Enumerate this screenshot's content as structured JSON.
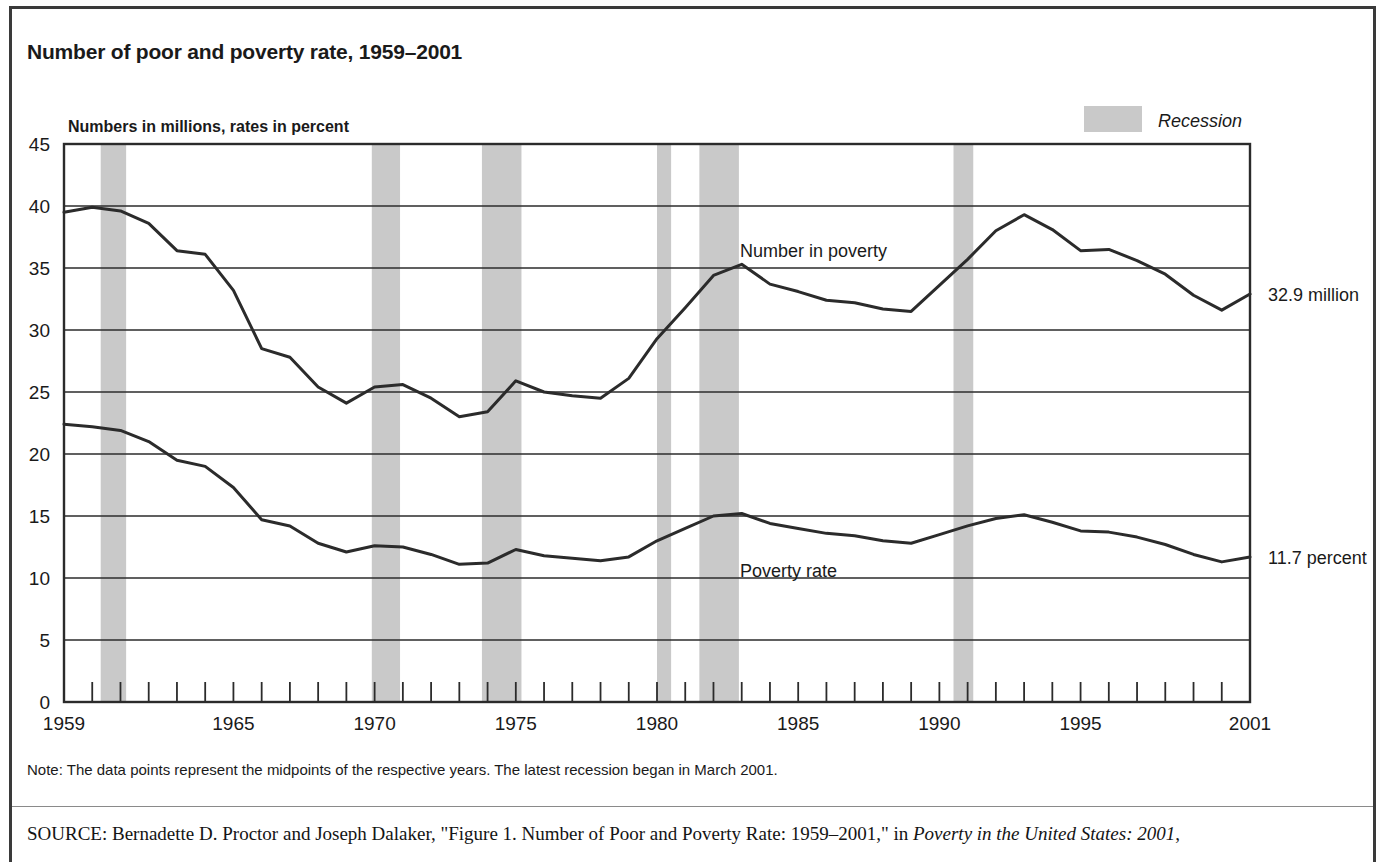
{
  "figure": {
    "title": "Number of poor and poverty rate, 1959–2001",
    "note": "Note: The data points represent the midpoints of the respective years. The latest recession began in March 2001.",
    "source_label": "SOURCE",
    "source_text_before_italic": ": Bernadette D. Proctor and Joseph Dalaker, \"Figure 1. Number of Poor and Poverty Rate: 1959–2001,\" in ",
    "source_italic": "Poverty in the United States: 2001",
    "source_text_after_italic": ","
  },
  "legend": {
    "recession_label": "Recession",
    "recession_color": "#c9c9c9"
  },
  "annotations": {
    "number_endpoint": "32.9 million",
    "rate_endpoint": "11.7 percent",
    "number_series_label": "Number in poverty",
    "rate_series_label": "Poverty rate"
  },
  "chart_data": {
    "type": "line",
    "title": "Number of poor and poverty rate, 1959–2001",
    "subtitle": "Numbers in millions, rates in percent",
    "xlabel": "",
    "ylabel": "Numbers in millions, rates in percent",
    "xlim": [
      1959,
      2001
    ],
    "ylim": [
      0,
      45
    ],
    "y_ticks": [
      0,
      5,
      10,
      15,
      20,
      25,
      30,
      35,
      40,
      45
    ],
    "x_tick_years_all": [
      1959,
      1960,
      1961,
      1962,
      1963,
      1964,
      1965,
      1966,
      1967,
      1968,
      1969,
      1970,
      1971,
      1972,
      1973,
      1974,
      1975,
      1976,
      1977,
      1978,
      1979,
      1980,
      1981,
      1982,
      1983,
      1984,
      1985,
      1986,
      1987,
      1988,
      1989,
      1990,
      1991,
      1992,
      1993,
      1994,
      1995,
      1996,
      1997,
      1998,
      1999,
      2000,
      2001
    ],
    "x_tick_labels": [
      {
        "year": 1959,
        "label": "1959"
      },
      {
        "year": 1965,
        "label": "1965"
      },
      {
        "year": 1970,
        "label": "1970"
      },
      {
        "year": 1975,
        "label": "1975"
      },
      {
        "year": 1980,
        "label": "1980"
      },
      {
        "year": 1985,
        "label": "1985"
      },
      {
        "year": 1990,
        "label": "1990"
      },
      {
        "year": 1995,
        "label": "1995"
      },
      {
        "year": 2001,
        "label": "2001"
      }
    ],
    "grid": "horizontal",
    "legend_position": "top-right",
    "line_color": "#2b2b2b",
    "series": [
      {
        "name": "Number in poverty",
        "unit": "millions",
        "x": [
          1959,
          1960,
          1961,
          1962,
          1963,
          1964,
          1965,
          1966,
          1967,
          1968,
          1969,
          1970,
          1971,
          1972,
          1973,
          1974,
          1975,
          1976,
          1977,
          1978,
          1979,
          1980,
          1981,
          1982,
          1983,
          1984,
          1985,
          1986,
          1987,
          1988,
          1989,
          1990,
          1991,
          1992,
          1993,
          1994,
          1995,
          1996,
          1997,
          1998,
          1999,
          2000,
          2001
        ],
        "values": [
          39.5,
          39.9,
          39.6,
          38.6,
          36.4,
          36.1,
          33.2,
          28.5,
          27.8,
          25.4,
          24.1,
          25.4,
          25.6,
          24.5,
          23.0,
          23.4,
          25.9,
          25.0,
          24.7,
          24.5,
          26.1,
          29.3,
          31.8,
          34.4,
          35.3,
          33.7,
          33.1,
          32.4,
          32.2,
          31.7,
          31.5,
          33.6,
          35.7,
          38.0,
          39.3,
          38.1,
          36.4,
          36.5,
          35.6,
          34.5,
          32.8,
          31.6,
          32.9
        ]
      },
      {
        "name": "Poverty rate",
        "unit": "percent",
        "x": [
          1959,
          1960,
          1961,
          1962,
          1963,
          1964,
          1965,
          1966,
          1967,
          1968,
          1969,
          1970,
          1971,
          1972,
          1973,
          1974,
          1975,
          1976,
          1977,
          1978,
          1979,
          1980,
          1981,
          1982,
          1983,
          1984,
          1985,
          1986,
          1987,
          1988,
          1989,
          1990,
          1991,
          1992,
          1993,
          1994,
          1995,
          1996,
          1997,
          1998,
          1999,
          2000,
          2001
        ],
        "values": [
          22.4,
          22.2,
          21.9,
          21.0,
          19.5,
          19.0,
          17.3,
          14.7,
          14.2,
          12.8,
          12.1,
          12.6,
          12.5,
          11.9,
          11.1,
          11.2,
          12.3,
          11.8,
          11.6,
          11.4,
          11.7,
          13.0,
          14.0,
          15.0,
          15.2,
          14.4,
          14.0,
          13.6,
          13.4,
          13.0,
          12.8,
          13.5,
          14.2,
          14.8,
          15.1,
          14.5,
          13.8,
          13.7,
          13.3,
          12.7,
          11.9,
          11.3,
          11.7
        ]
      }
    ],
    "recession_bands": [
      {
        "start": 1960.3,
        "end": 1961.2
      },
      {
        "start": 1969.9,
        "end": 1970.9
      },
      {
        "start": 1973.8,
        "end": 1975.2
      },
      {
        "start": 1980.0,
        "end": 1980.5
      },
      {
        "start": 1981.5,
        "end": 1982.9
      },
      {
        "start": 1990.5,
        "end": 1991.2
      },
      {
        "start": 2001.0,
        "end": 2001.6
      }
    ],
    "endpoint_annotations": [
      {
        "series": "Number in poverty",
        "year": 2001,
        "value": 32.9,
        "label": "32.9 million"
      },
      {
        "series": "Poverty rate",
        "year": 2001,
        "value": 11.7,
        "label": "11.7 percent"
      }
    ]
  }
}
